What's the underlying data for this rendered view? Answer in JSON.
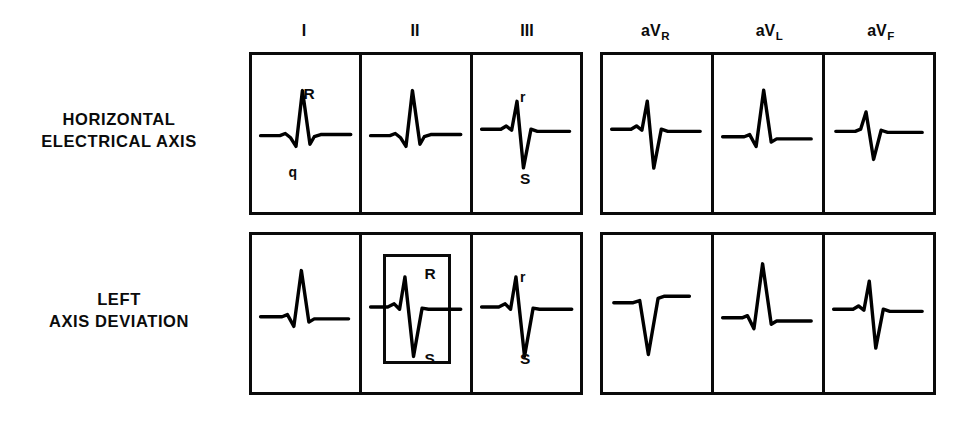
{
  "figure": {
    "background_color": "#ffffff",
    "ink_color": "#000000"
  },
  "columns": {
    "left_group": [
      {
        "id": "I",
        "label": "I",
        "sub": ""
      },
      {
        "id": "II",
        "label": "II",
        "sub": ""
      },
      {
        "id": "III",
        "label": "III",
        "sub": ""
      }
    ],
    "right_group": [
      {
        "id": "aVR",
        "label": "aV",
        "sub": "R"
      },
      {
        "id": "aVL",
        "label": "aV",
        "sub": "L"
      },
      {
        "id": "aVF",
        "label": "aV",
        "sub": "F"
      }
    ]
  },
  "rows": [
    {
      "id": "horizontal-electrical-axis",
      "label_line1": "HORIZONTAL",
      "label_line2": "ELECTRICAL AXIS",
      "cells": [
        {
          "lead": "I",
          "morphology": "qRs",
          "annotations": [
            {
              "text": "R",
              "x_pct": 48,
              "y_pct": 20
            },
            {
              "text": "q",
              "x_pct": 34,
              "y_pct": 70
            }
          ]
        },
        {
          "lead": "II",
          "morphology": "qRs",
          "annotations": []
        },
        {
          "lead": "III",
          "morphology": "rS",
          "annotations": [
            {
              "text": "r",
              "x_pct": 44,
              "y_pct": 22
            },
            {
              "text": "S",
              "x_pct": 44,
              "y_pct": 74
            }
          ]
        },
        {
          "lead": "aVR",
          "morphology": "rS",
          "annotations": []
        },
        {
          "lead": "aVL",
          "morphology": "qR",
          "annotations": []
        },
        {
          "lead": "aVF",
          "morphology": "rS-small",
          "annotations": []
        }
      ]
    },
    {
      "id": "left-axis-deviation",
      "label_line1": "LEFT",
      "label_line2": "AXIS DEVIATION",
      "cells": [
        {
          "lead": "I",
          "morphology": "qR",
          "annotations": []
        },
        {
          "lead": "II",
          "morphology": "rS-deep",
          "highlighted": true,
          "annotations": [
            {
              "text": "R",
              "x_pct": 58,
              "y_pct": 20
            },
            {
              "text": "S",
              "x_pct": 58,
              "y_pct": 74
            }
          ]
        },
        {
          "lead": "III",
          "morphology": "rS-deep",
          "annotations": [
            {
              "text": "r",
              "x_pct": 44,
              "y_pct": 22
            },
            {
              "text": "S",
              "x_pct": 44,
              "y_pct": 74
            }
          ]
        },
        {
          "lead": "aVR",
          "morphology": "QS",
          "annotations": []
        },
        {
          "lead": "aVL",
          "morphology": "qR-tall",
          "annotations": []
        },
        {
          "lead": "aVF",
          "morphology": "rS",
          "annotations": []
        }
      ]
    }
  ],
  "waveform_paths": {
    "qRs": "M 8 62 L 26 62 L 31 60 L 36 64 L 41 72 L 47 20 L 54 70 L 58 63 L 64 61 L 92 61",
    "qR": "M 8 63 L 28 63 L 33 61 L 39 72 L 46 20 L 53 68 L 58 65 L 90 65",
    "qR-tall": "M 8 64 L 26 64 L 31 62 L 37 74 L 45 14 L 53 70 L 58 67 L 90 67",
    "rS": "M 8 56 L 26 56 L 31 53 L 36 57 L 41 30 L 47 92 L 54 56 L 60 58 L 90 58",
    "rS-small": "M 10 58 L 28 58 L 33 56 L 38 40 L 45 84 L 52 57 L 58 59 L 90 59",
    "rS-deep": "M 8 54 L 24 54 L 30 51 L 35 56 L 40 26 L 48 100 L 56 55 L 62 56 L 92 56",
    "QS": "M 10 50 L 28 50 L 34 48 L 42 98 L 51 46 L 57 44 L 80 44"
  },
  "layout": {
    "left_grid": {
      "x": 249,
      "y": 52,
      "w": 334,
      "h": 163
    },
    "right_grid": {
      "x": 600,
      "y": 52,
      "w": 336,
      "h": 163
    },
    "row_gap": 180,
    "inset": {
      "x_pct": 19,
      "y_pct": 12,
      "w_pct": 64,
      "h_pct": 70
    }
  }
}
